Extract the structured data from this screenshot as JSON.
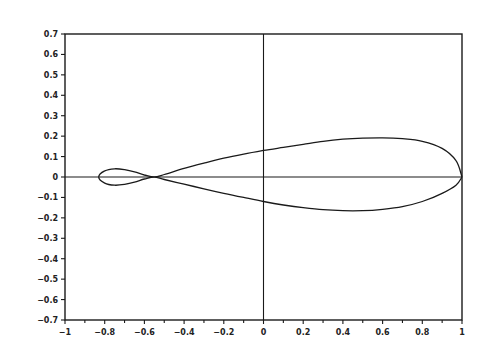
{
  "chart_data": {
    "type": "line",
    "title": "",
    "xlabel": "",
    "ylabel": "",
    "xlim": [
      -1,
      1
    ],
    "ylim": [
      -0.7,
      0.7
    ],
    "grid": false,
    "legend": null,
    "x_ticks": [
      "-1",
      "-0.8",
      "-0.6",
      "-0.4",
      "-0.2",
      "0",
      "0.2",
      "0.4",
      "0.6",
      "0.8",
      "1"
    ],
    "y_ticks": [
      "0.7",
      "0.6",
      "0.5",
      "0.4",
      "0.3",
      "0.2",
      "0.1",
      "0",
      "-0.1",
      "-0.2",
      "-0.3",
      "-0.4",
      "-0.5",
      "-0.6",
      "-0.7"
    ],
    "reference_lines": [
      {
        "orientation": "horizontal",
        "value": 0
      },
      {
        "orientation": "vertical",
        "value": 0
      }
    ],
    "series": [
      {
        "name": "closed curve (small loop + large lobe)",
        "points": [
          [
            1.0,
            0.0
          ],
          [
            0.97,
            0.08
          ],
          [
            0.9,
            0.14
          ],
          [
            0.8,
            0.175
          ],
          [
            0.7,
            0.188
          ],
          [
            0.6,
            0.192
          ],
          [
            0.5,
            0.19
          ],
          [
            0.4,
            0.185
          ],
          [
            0.3,
            0.175
          ],
          [
            0.2,
            0.16
          ],
          [
            0.1,
            0.145
          ],
          [
            0.0,
            0.13
          ],
          [
            -0.1,
            0.112
          ],
          [
            -0.2,
            0.092
          ],
          [
            -0.3,
            0.068
          ],
          [
            -0.4,
            0.042
          ],
          [
            -0.5,
            0.012
          ],
          [
            -0.55,
            0.0
          ],
          [
            -0.6,
            0.01
          ],
          [
            -0.65,
            0.025
          ],
          [
            -0.7,
            0.036
          ],
          [
            -0.75,
            0.04
          ],
          [
            -0.8,
            0.03
          ],
          [
            -0.83,
            0.0
          ],
          [
            -0.8,
            -0.03
          ],
          [
            -0.75,
            -0.04
          ],
          [
            -0.7,
            -0.036
          ],
          [
            -0.65,
            -0.025
          ],
          [
            -0.6,
            -0.01
          ],
          [
            -0.55,
            0.0
          ],
          [
            -0.5,
            -0.012
          ],
          [
            -0.4,
            -0.035
          ],
          [
            -0.3,
            -0.058
          ],
          [
            -0.2,
            -0.08
          ],
          [
            -0.1,
            -0.1
          ],
          [
            0.0,
            -0.12
          ],
          [
            0.1,
            -0.137
          ],
          [
            0.2,
            -0.15
          ],
          [
            0.3,
            -0.16
          ],
          [
            0.4,
            -0.165
          ],
          [
            0.5,
            -0.165
          ],
          [
            0.6,
            -0.158
          ],
          [
            0.7,
            -0.145
          ],
          [
            0.8,
            -0.12
          ],
          [
            0.9,
            -0.08
          ],
          [
            0.97,
            -0.04
          ],
          [
            1.0,
            0.0
          ]
        ]
      }
    ]
  }
}
